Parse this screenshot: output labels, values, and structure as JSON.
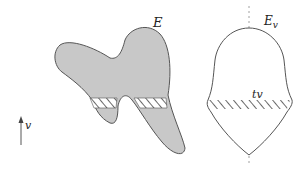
{
  "figure": {
    "shape_label": "E",
    "symmetrized_label": "E",
    "symmetrized_subscript": "v",
    "slice_label": "tv",
    "direction_label": "v",
    "colors": {
      "shape_fill": "#c8c8c8",
      "outline": "#555555",
      "axis": "#888888",
      "hatch": "#444444"
    }
  }
}
